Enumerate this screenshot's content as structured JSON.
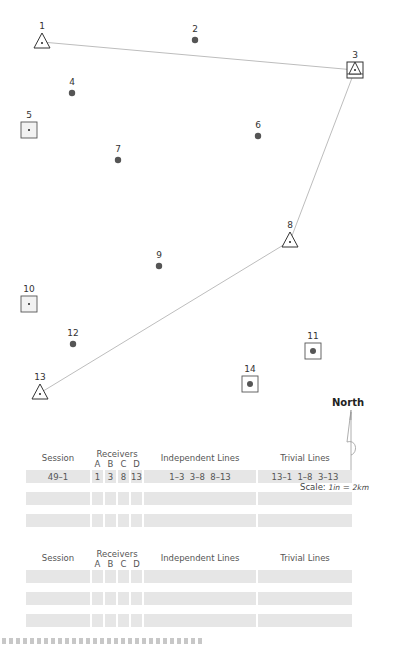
{
  "points": [
    {
      "id": "1",
      "label": "1",
      "type": "triangle",
      "x": 42,
      "y": 42
    },
    {
      "id": "2",
      "label": "2",
      "type": "dot",
      "x": 195,
      "y": 40
    },
    {
      "id": "3",
      "label": "3",
      "type": "square-triangle",
      "x": 355,
      "y": 70
    },
    {
      "id": "4",
      "label": "4",
      "type": "dot",
      "x": 72,
      "y": 93
    },
    {
      "id": "5",
      "label": "5",
      "type": "square",
      "x": 29,
      "y": 130
    },
    {
      "id": "6",
      "label": "6",
      "type": "dot",
      "x": 258,
      "y": 136
    },
    {
      "id": "7",
      "label": "7",
      "type": "dot",
      "x": 118,
      "y": 160
    },
    {
      "id": "8",
      "label": "8",
      "type": "triangle",
      "x": 290,
      "y": 241
    },
    {
      "id": "9",
      "label": "9",
      "type": "dot",
      "x": 159,
      "y": 266
    },
    {
      "id": "10",
      "label": "10",
      "type": "square",
      "x": 29,
      "y": 304
    },
    {
      "id": "11",
      "label": "11",
      "type": "square-dot",
      "x": 313,
      "y": 351
    },
    {
      "id": "12",
      "label": "12",
      "type": "dot",
      "x": 73,
      "y": 344
    },
    {
      "id": "13",
      "label": "13",
      "type": "triangle",
      "x": 40,
      "y": 393
    },
    {
      "id": "14",
      "label": "14",
      "type": "square-dot",
      "x": 250,
      "y": 384
    }
  ],
  "lines": [
    [
      "1",
      "3"
    ],
    [
      "3",
      "8"
    ],
    [
      "8",
      "13"
    ]
  ],
  "north_arrow": {
    "label": "North"
  },
  "scale": {
    "prefix": "Scale: ",
    "left": "1in",
    "equals": " = ",
    "right": "2km"
  },
  "tables": [
    {
      "headers": {
        "session": "Session",
        "receivers": "Receivers",
        "receiver_cols": [
          "A",
          "B",
          "C",
          "D"
        ],
        "independent": "Independent Lines",
        "trivial": "Trivial Lines"
      },
      "rows": [
        {
          "session": "49–1",
          "A": "1",
          "B": "3",
          "C": "8",
          "D": "13",
          "independent": "1–3  3–8  8–13",
          "trivial": "13–1  1–8  3–13"
        },
        {
          "session": "",
          "A": "",
          "B": "",
          "C": "",
          "D": "",
          "independent": "",
          "trivial": ""
        },
        {
          "session": "",
          "A": "",
          "B": "",
          "C": "",
          "D": "",
          "independent": "",
          "trivial": ""
        }
      ]
    },
    {
      "headers": {
        "session": "Session",
        "receivers": "Receivers",
        "receiver_cols": [
          "A",
          "B",
          "C",
          "D"
        ],
        "independent": "Independent Lines",
        "trivial": "Trivial Lines"
      },
      "rows": [
        {
          "session": "",
          "A": "",
          "B": "",
          "C": "",
          "D": "",
          "independent": "",
          "trivial": ""
        },
        {
          "session": "",
          "A": "",
          "B": "",
          "C": "",
          "D": "",
          "independent": "",
          "trivial": ""
        },
        {
          "session": "",
          "A": "",
          "B": "",
          "C": "",
          "D": "",
          "independent": "",
          "trivial": ""
        }
      ]
    }
  ],
  "colors": {
    "line": "#bdbdbd",
    "marker_stroke": "#333333",
    "dot": "#555555",
    "square_fill": "#f2f2f2",
    "row_fill": "#e6e6e6"
  }
}
